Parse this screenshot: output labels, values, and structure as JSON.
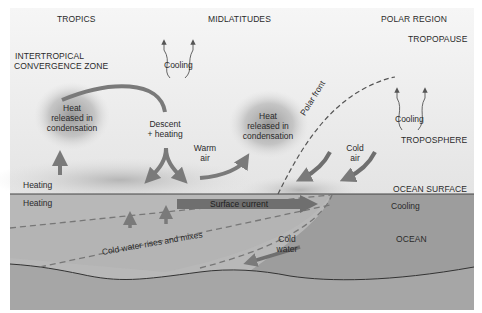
{
  "regions": {
    "tropics": "TROPICS",
    "midlatitudes": "MIDLATITUDES",
    "polar": "POLAR REGION"
  },
  "layers": {
    "tropopause": "TROPOPAUSE",
    "troposphere": "TROPOSPHERE",
    "ocean_surface": "OCEAN SURFACE",
    "ocean": "OCEAN"
  },
  "labels": {
    "itcz_line1": "INTERTROPICAL",
    "itcz_line2": "CONVERGENCE ZONE",
    "cooling_mid": "Cooling",
    "cooling_polar": "Cooling",
    "heat1_l1": "Heat",
    "heat1_l2": "released in",
    "heat1_l3": "condensation",
    "descent_l1": "Descent",
    "descent_l2": "+ heating",
    "warm_l1": "Warm",
    "warm_l2": "air",
    "heat2_l1": "Heat",
    "heat2_l2": "released in",
    "heat2_l3": "condensation",
    "polar_front": "Polar front",
    "cold_air_l1": "Cold",
    "cold_air_l2": "air",
    "heating_air": "Heating",
    "heating_ocean": "Heating",
    "surface_current": "Surface current",
    "cooling_ocean": "Cooling",
    "cold_water_rises": "Cold water rises and mixes",
    "cold_water_l1": "Cold",
    "cold_water_l2": "water"
  },
  "colors": {
    "sky_top": "#f4f4f4",
    "sky_bottom": "#e6e6e6",
    "ocean_light": "#b9b9b9",
    "ocean_dark": "#999999",
    "seafloor": "#a8a8a8",
    "arrow": "#7a7a7a",
    "text": "#2a2a2a"
  }
}
